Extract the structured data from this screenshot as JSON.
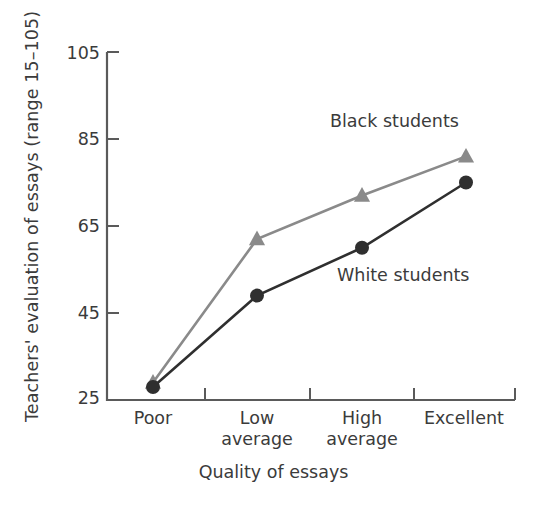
{
  "chart_data": {
    "type": "line",
    "title": "",
    "categories": [
      "Poor",
      "Low average",
      "High average",
      "Excellent"
    ],
    "category_lines": [
      [
        "Poor"
      ],
      [
        "Low",
        "average"
      ],
      [
        "High",
        "average"
      ],
      [
        "Excellent"
      ]
    ],
    "series": [
      {
        "name": "Black students",
        "values": [
          29,
          62,
          72,
          81
        ],
        "color": "#8a8a8a",
        "marker": "triangle"
      },
      {
        "name": "White students",
        "values": [
          28,
          49,
          60,
          75
        ],
        "color": "#2f2f2f",
        "marker": "circle"
      }
    ],
    "xlabel": "Quality of essays",
    "ylabel": "Teachers' evaluation of essays (range 15–105)",
    "yticks": [
      25,
      45,
      65,
      85,
      105
    ],
    "ylim": [
      25,
      105
    ],
    "grid": false,
    "legend": "inline-annotations",
    "annotations": [
      {
        "text": "Black students",
        "series": "Black students"
      },
      {
        "text": "White students",
        "series": "White students"
      }
    ]
  },
  "axes": {
    "axis_color": "#5a5a5a",
    "background": "#ffffff"
  }
}
